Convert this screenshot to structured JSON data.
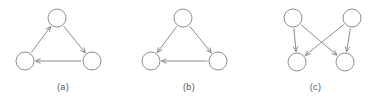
{
  "figure": {
    "background_color": "#ffffff",
    "stroke_color": "#8d8d8d",
    "caption_color": "#555555",
    "panels": [
      {
        "id": "a",
        "caption": "(a)",
        "description": "directed three-node cycle",
        "nodes": [
          {
            "id": "top",
            "cx": 57,
            "cy": 18,
            "r": 9
          },
          {
            "id": "bottom-left",
            "cx": 25,
            "cy": 61,
            "r": 9
          },
          {
            "id": "bottom-right",
            "cx": 92,
            "cy": 61,
            "r": 9
          }
        ],
        "edges": [
          {
            "from": "bottom-left",
            "to": "top",
            "directed": true
          },
          {
            "from": "top",
            "to": "bottom-right",
            "directed": true
          },
          {
            "from": "bottom-right",
            "to": "bottom-left",
            "directed": true
          }
        ]
      },
      {
        "id": "b",
        "caption": "(b)",
        "description": "directed acyclic three-node graph",
        "nodes": [
          {
            "id": "top",
            "cx": 57,
            "cy": 18,
            "r": 9
          },
          {
            "id": "bottom-left",
            "cx": 25,
            "cy": 61,
            "r": 9
          },
          {
            "id": "bottom-right",
            "cx": 92,
            "cy": 61,
            "r": 9
          }
        ],
        "edges": [
          {
            "from": "top",
            "to": "bottom-left",
            "directed": true
          },
          {
            "from": "top",
            "to": "bottom-right",
            "directed": true
          },
          {
            "from": "bottom-right",
            "to": "bottom-left",
            "directed": true
          }
        ]
      },
      {
        "id": "c",
        "caption": "(c)",
        "description": "four-node bipartite graph with crossing edges",
        "nodes": [
          {
            "id": "top-left",
            "cx": 41,
            "cy": 18,
            "r": 9
          },
          {
            "id": "top-right",
            "cx": 100,
            "cy": 18,
            "r": 9
          },
          {
            "id": "bottom-left",
            "cx": 45,
            "cy": 62,
            "r": 9
          },
          {
            "id": "bottom-right",
            "cx": 93,
            "cy": 62,
            "r": 9
          }
        ],
        "edges": [
          {
            "from": "top-left",
            "to": "bottom-left",
            "directed": true
          },
          {
            "from": "top-left",
            "to": "bottom-right",
            "directed": true
          },
          {
            "from": "top-right",
            "to": "bottom-right",
            "directed": true
          },
          {
            "from": "top-right",
            "to": "bottom-left",
            "directed": true
          }
        ]
      }
    ]
  }
}
